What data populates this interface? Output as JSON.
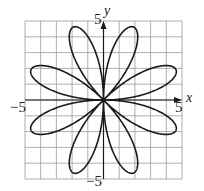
{
  "chart_data": {
    "type": "line",
    "title": "",
    "equation_form": "polar rose r = 5 sin(4θ)",
    "petals": 8,
    "amplitude": 5,
    "xlabel": "x",
    "ylabel": "y",
    "xlim": [
      -5,
      5
    ],
    "ylim": [
      -5,
      5
    ],
    "grid": true,
    "grid_step": 1,
    "tick_labels": {
      "x_min": "−5",
      "x_max": "5",
      "y_min": "−5",
      "y_max": "5"
    },
    "series": [
      {
        "name": "rose",
        "color": "#1a1a1a"
      }
    ]
  },
  "colors": {
    "grid": "#9a9a9a",
    "axis": "#1a1a1a",
    "curve": "#1a1a1a",
    "background": "#ffffff"
  }
}
